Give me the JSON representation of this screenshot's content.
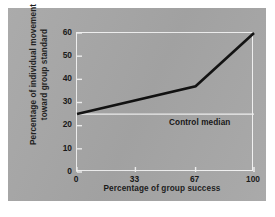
{
  "figure": {
    "background_color": "#a7a7a7",
    "page_color": "#ffffff",
    "frame_color": "#f2f2f2",
    "line_color": "#111111"
  },
  "chart_data": {
    "type": "line",
    "title": "",
    "xlabel": "Percentage of group success",
    "ylabel": "Percentage of individual movement\ntoward group standard",
    "xlim": [
      0,
      100
    ],
    "ylim": [
      0,
      60
    ],
    "grid": false,
    "legend": "none",
    "xticks": [
      0,
      33,
      67,
      100
    ],
    "xtick_labels": [
      "0",
      "33",
      "67",
      "100"
    ],
    "yticks": [
      0,
      10,
      20,
      30,
      40,
      50,
      60
    ],
    "ytick_labels": [
      "0",
      "10",
      "20",
      "30",
      "40",
      "50",
      "60"
    ],
    "series": [
      {
        "name": "Percentage of individual movement toward group standard",
        "color": "#111111",
        "x": [
          0,
          67,
          100
        ],
        "values": [
          25,
          37,
          60
        ]
      }
    ],
    "annotations": [
      {
        "name": "control-median",
        "label": "Control median",
        "type": "horizontal-line",
        "y": 25,
        "color": "#f2f2f2",
        "label_x": 52,
        "label_y": 21
      }
    ]
  }
}
